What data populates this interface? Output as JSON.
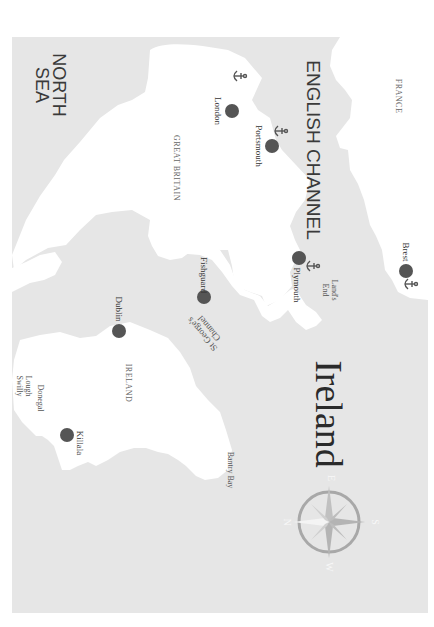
{
  "map": {
    "title": "Ireland",
    "colors": {
      "sea": "#e6e6e6",
      "land": "#ffffff",
      "city_dot": "#555555",
      "compass": "#a8a8a8",
      "text": "#333333"
    },
    "orientation": "rotated 90° clockwise",
    "seas": [
      {
        "id": "north-sea",
        "line1": "NORTH",
        "line2": "SEA"
      },
      {
        "id": "english-channel",
        "label": "ENGLISH CHANNEL"
      },
      {
        "id": "st-georges-channel",
        "line1": "St George's",
        "line2": "Channel"
      },
      {
        "id": "bantry-bay",
        "label": "Bantry Bay"
      },
      {
        "id": "lough-swilly",
        "line1": "Lough",
        "line2": "Swilly"
      },
      {
        "id": "donegal",
        "label": "Donegal"
      }
    ],
    "regions": [
      {
        "id": "great-britain",
        "label": "GREAT BRITAIN"
      },
      {
        "id": "ireland",
        "label": "IRELAND"
      },
      {
        "id": "france",
        "label": "FRANCE"
      }
    ],
    "places": [
      {
        "id": "lands-end",
        "line1": "Land's",
        "line2": "End"
      }
    ],
    "cities": [
      {
        "name": "London",
        "anchor": true
      },
      {
        "name": "Portsmouth",
        "anchor": true
      },
      {
        "name": "Plymouth",
        "anchor": true
      },
      {
        "name": "Brest",
        "anchor": true
      },
      {
        "name": "Fishguard",
        "anchor": false
      },
      {
        "name": "Dublin",
        "anchor": false
      },
      {
        "name": "Killala",
        "anchor": false
      }
    ],
    "compass": {
      "n": "N",
      "e": "E",
      "s": "S",
      "w": "W"
    }
  }
}
